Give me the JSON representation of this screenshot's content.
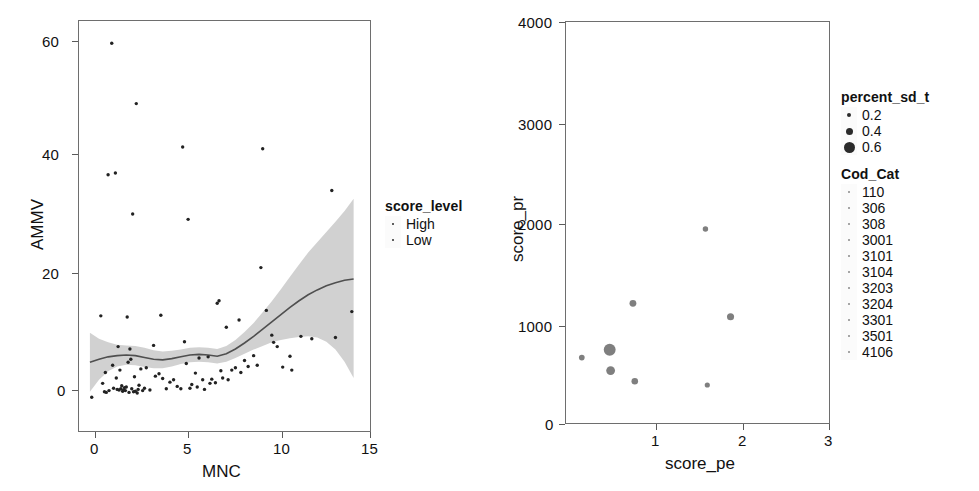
{
  "figure": {
    "type": "multi-panel-scatter",
    "panel_count": 2
  },
  "left_panel": {
    "xlabel": "MNC",
    "ylabel": "AMMV",
    "legend": {
      "title": "score_level",
      "items": [
        {
          "label": "High",
          "marker": "point"
        },
        {
          "label": "Low",
          "marker": "point"
        }
      ]
    },
    "xticks": [
      "0",
      "5",
      "10",
      "15"
    ],
    "yticks": [
      "0",
      "20",
      "40",
      "60"
    ]
  },
  "right_panel": {
    "xlabel": "score_pe",
    "ylabel": "score_pr",
    "xticks": [
      "1",
      "2",
      "3"
    ],
    "yticks": [
      "0",
      "1000",
      "2000",
      "3000",
      "4000"
    ],
    "legend_size": {
      "title": "percent_sd_t",
      "items": [
        {
          "label": "0.2",
          "radius_px": 2
        },
        {
          "label": "0.4",
          "radius_px": 3.5
        },
        {
          "label": "0.6",
          "radius_px": 5.5
        }
      ]
    },
    "legend_cat": {
      "title": "Cod_Cat",
      "items": [
        {
          "label": "110"
        },
        {
          "label": "306"
        },
        {
          "label": "308"
        },
        {
          "label": "3001"
        },
        {
          "label": "3101"
        },
        {
          "label": "3104"
        },
        {
          "label": "3203"
        },
        {
          "label": "3204"
        },
        {
          "label": "3301"
        },
        {
          "label": "3501"
        },
        {
          "label": "4106"
        }
      ]
    }
  },
  "chart_data": [
    {
      "type": "scatter",
      "panel": "left",
      "title": "",
      "xlabel": "MNC",
      "ylabel": "AMMV",
      "xlim": [
        -0.6,
        15.4
      ],
      "ylim": [
        -5.5,
        62.5
      ],
      "xticks": [
        0,
        5,
        10,
        15
      ],
      "yticks": [
        0,
        20,
        40,
        60
      ],
      "grid": false,
      "legend": {
        "title": "score_level",
        "entries": [
          "High",
          "Low"
        ],
        "position": "right"
      },
      "smooth": {
        "label": "loess",
        "band": "confidence-ribbon",
        "x": [
          0.0,
          0.5,
          1.0,
          1.5,
          2.0,
          2.5,
          3.0,
          3.5,
          4.0,
          4.5,
          5.0,
          5.5,
          6.0,
          6.5,
          7.0,
          7.5,
          8.0,
          8.5,
          9.0,
          9.5,
          10.0,
          10.5,
          11.0,
          11.5,
          12.0,
          12.5,
          13.0,
          13.5,
          14.0,
          14.5
        ],
        "y": [
          5.9,
          6.4,
          6.8,
          7.0,
          7.1,
          7.0,
          6.7,
          6.4,
          6.3,
          6.5,
          6.8,
          7.1,
          7.2,
          7.1,
          6.9,
          7.3,
          8.1,
          9.1,
          10.2,
          11.4,
          12.6,
          13.8,
          15.0,
          16.1,
          17.1,
          17.9,
          18.6,
          19.1,
          19.5,
          19.7
        ],
        "ylow": [
          1.0,
          3.0,
          4.4,
          5.2,
          5.5,
          5.4,
          5.1,
          4.9,
          4.9,
          5.2,
          5.6,
          5.9,
          6.0,
          5.9,
          5.7,
          6.0,
          6.6,
          7.3,
          8.0,
          8.6,
          9.2,
          9.6,
          9.9,
          10.1,
          10.2,
          10.0,
          9.3,
          8.0,
          6.0,
          3.3
        ],
        "yhigh": [
          10.8,
          9.8,
          9.2,
          8.8,
          8.7,
          8.6,
          8.3,
          7.9,
          7.7,
          7.8,
          8.0,
          8.3,
          8.4,
          8.3,
          8.1,
          8.6,
          9.6,
          10.9,
          12.4,
          14.2,
          16.0,
          18.0,
          20.1,
          22.1,
          24.1,
          25.8,
          27.5,
          29.2,
          31.0,
          33.0
        ]
      },
      "points": [
        [
          0.1,
          0.1
        ],
        [
          0.6,
          13.6
        ],
        [
          0.7,
          2.4
        ],
        [
          0.8,
          1.0
        ],
        [
          0.85,
          4.2
        ],
        [
          0.9,
          0.9
        ],
        [
          1.0,
          37.0
        ],
        [
          1.05,
          1.2
        ],
        [
          1.2,
          58.8
        ],
        [
          1.25,
          5.4
        ],
        [
          1.3,
          1.6
        ],
        [
          1.4,
          37.3
        ],
        [
          1.45,
          3.3
        ],
        [
          1.5,
          1.4
        ],
        [
          1.55,
          8.5
        ],
        [
          1.6,
          1.3
        ],
        [
          1.65,
          4.6
        ],
        [
          1.7,
          1.5
        ],
        [
          1.75,
          2.0
        ],
        [
          1.8,
          1.1
        ],
        [
          1.85,
          1.3
        ],
        [
          1.9,
          1.7
        ],
        [
          1.95,
          1.2
        ],
        [
          2.0,
          1.8
        ],
        [
          2.05,
          13.4
        ],
        [
          2.1,
          5.9
        ],
        [
          2.15,
          0.9
        ],
        [
          2.2,
          8.1
        ],
        [
          2.25,
          6.4
        ],
        [
          2.3,
          1.5
        ],
        [
          2.35,
          30.5
        ],
        [
          2.4,
          1.0
        ],
        [
          2.45,
          3.5
        ],
        [
          2.5,
          1.1
        ],
        [
          2.55,
          48.8
        ],
        [
          2.6,
          0.8
        ],
        [
          2.65,
          1.4
        ],
        [
          2.7,
          2.1
        ],
        [
          2.8,
          4.8
        ],
        [
          2.9,
          1.2
        ],
        [
          3.0,
          1.6
        ],
        [
          3.1,
          5.0
        ],
        [
          3.3,
          1.3
        ],
        [
          3.5,
          8.7
        ],
        [
          3.6,
          3.6
        ],
        [
          3.8,
          4.0
        ],
        [
          3.9,
          13.7
        ],
        [
          4.0,
          3.2
        ],
        [
          4.2,
          1.5
        ],
        [
          4.4,
          2.6
        ],
        [
          4.6,
          3.0
        ],
        [
          4.8,
          1.9
        ],
        [
          5.0,
          1.5
        ],
        [
          5.1,
          41.6
        ],
        [
          5.2,
          9.3
        ],
        [
          5.3,
          5.7
        ],
        [
          5.4,
          29.6
        ],
        [
          5.5,
          1.6
        ],
        [
          5.6,
          2.2
        ],
        [
          5.8,
          4.1
        ],
        [
          5.9,
          1.8
        ],
        [
          6.0,
          6.6
        ],
        [
          6.2,
          3.0
        ],
        [
          6.3,
          1.4
        ],
        [
          6.5,
          6.8
        ],
        [
          6.6,
          2.4
        ],
        [
          6.7,
          3.1
        ],
        [
          6.9,
          2.5
        ],
        [
          7.0,
          15.7
        ],
        [
          7.1,
          16.1
        ],
        [
          7.2,
          4.5
        ],
        [
          7.3,
          3.3
        ],
        [
          7.5,
          11.7
        ],
        [
          7.6,
          3.0
        ],
        [
          7.8,
          4.6
        ],
        [
          8.0,
          5.0
        ],
        [
          8.2,
          12.9
        ],
        [
          8.3,
          4.2
        ],
        [
          8.5,
          6.2
        ],
        [
          8.7,
          5.2
        ],
        [
          9.0,
          7.0
        ],
        [
          9.2,
          5.4
        ],
        [
          9.4,
          21.6
        ],
        [
          9.5,
          41.3
        ],
        [
          9.7,
          14.5
        ],
        [
          10.0,
          10.4
        ],
        [
          10.1,
          9.2
        ],
        [
          10.3,
          8.5
        ],
        [
          10.6,
          5.1
        ],
        [
          11.0,
          6.9
        ],
        [
          11.1,
          4.6
        ],
        [
          11.6,
          10.2
        ],
        [
          12.2,
          9.8
        ],
        [
          13.3,
          34.4
        ],
        [
          13.5,
          10.0
        ],
        [
          14.4,
          14.3
        ]
      ]
    },
    {
      "type": "scatter",
      "panel": "right",
      "title": "",
      "xlabel": "score_pe",
      "ylabel": "score_pr",
      "xlim": [
        0.38,
        3.22
      ],
      "ylim": [
        -180,
        4150
      ],
      "xticks": [
        1,
        2,
        3
      ],
      "yticks": [
        0,
        1000,
        2000,
        3000,
        4000
      ],
      "grid": false,
      "size_legend": {
        "title": "percent_sd_t",
        "entries": [
          0.2,
          0.4,
          0.6
        ]
      },
      "color_legend": {
        "title": "Cod_Cat",
        "entries": [
          110,
          306,
          308,
          3001,
          3101,
          3104,
          3203,
          3204,
          3301,
          3501,
          4106
        ]
      },
      "points": [
        {
          "x": 0.55,
          "y": 535,
          "size": 0.18
        },
        {
          "x": 0.85,
          "y": 620,
          "size": 0.62
        },
        {
          "x": 0.86,
          "y": 395,
          "size": 0.4
        },
        {
          "x": 1.1,
          "y": 1120,
          "size": 0.26
        },
        {
          "x": 1.12,
          "y": 280,
          "size": 0.24
        },
        {
          "x": 1.88,
          "y": 1920,
          "size": 0.16
        },
        {
          "x": 1.9,
          "y": 240,
          "size": 0.14
        },
        {
          "x": 2.15,
          "y": 975,
          "size": 0.28
        }
      ]
    }
  ]
}
